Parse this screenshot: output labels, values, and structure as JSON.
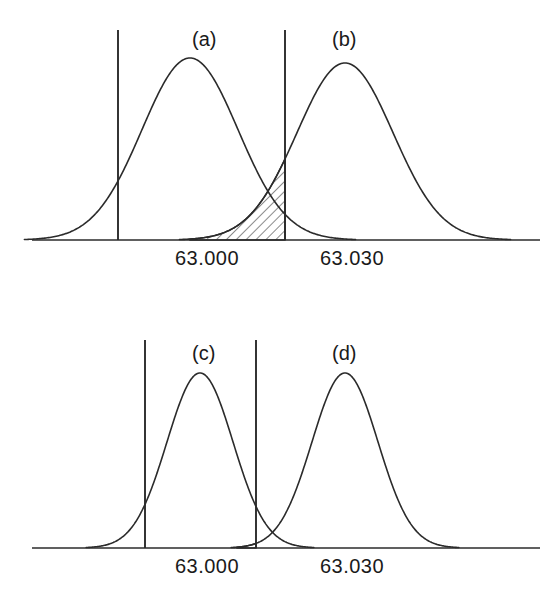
{
  "figure": {
    "title": "",
    "background": "#ffffff",
    "stroke_color": "#2b2b2b",
    "text_color": "#1a1a1a"
  },
  "chart_data": {
    "type": "line",
    "title": "",
    "xlabel": "",
    "ylabel": "",
    "grid": false,
    "legend_position": "inline-annotations",
    "axis_tick_labels": [
      "63.000",
      "63.030"
    ],
    "panels": [
      {
        "id": "top",
        "axis": {
          "y_px": 240,
          "x_start_px": 32,
          "x_end_px": 540
        },
        "x_ticks": [
          {
            "label": "63.000",
            "x_px": 207
          },
          {
            "label": "63.030",
            "x_px": 352
          }
        ],
        "vertical_lines": [
          {
            "name": "lower-spec-limit",
            "x_px": 118,
            "y_top_px": 30,
            "y_bottom_px": 240
          },
          {
            "name": "upper-spec-limit",
            "x_px": 285,
            "y_top_px": 30,
            "y_bottom_px": 240
          }
        ],
        "curves": [
          {
            "label": "(a)",
            "mean_px": 190,
            "sigma_px": 48,
            "peak_y_px": 58,
            "label_x_px": 192,
            "label_y_px": 46
          },
          {
            "label": "(b)",
            "mean_px": 345,
            "sigma_px": 48,
            "peak_y_px": 63,
            "label_x_px": 332,
            "label_y_px": 46
          }
        ],
        "shaded_region": {
          "name": "overlap-tail-area",
          "hatch": "diagonal-45",
          "x_from_px": 190,
          "x_to_px": 285,
          "bounded_by": "curve-b-left-tail"
        }
      },
      {
        "id": "bottom",
        "axis": {
          "y_px": 548,
          "x_start_px": 32,
          "x_end_px": 540
        },
        "x_ticks": [
          {
            "label": "63.000",
            "x_px": 207
          },
          {
            "label": "63.030",
            "x_px": 352
          }
        ],
        "vertical_lines": [
          {
            "name": "lower-spec-limit",
            "x_px": 145,
            "y_top_px": 340,
            "y_bottom_px": 548
          },
          {
            "name": "upper-spec-limit",
            "x_px": 256,
            "y_top_px": 340,
            "y_bottom_px": 548
          }
        ],
        "curves": [
          {
            "label": "(c)",
            "mean_px": 200,
            "sigma_px": 33,
            "peak_y_px": 373,
            "label_x_px": 192,
            "label_y_px": 360
          },
          {
            "label": "(d)",
            "mean_px": 345,
            "sigma_px": 33,
            "peak_y_px": 373,
            "label_x_px": 332,
            "label_y_px": 360
          }
        ],
        "shaded_region": {
          "name": "overlap-tail-area",
          "hatch": "diagonal-45",
          "x_from_px": 237,
          "x_to_px": 256,
          "bounded_by": "curve-d-left-tail"
        }
      }
    ]
  }
}
